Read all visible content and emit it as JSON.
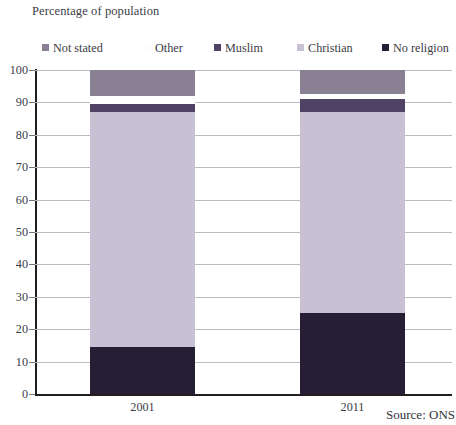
{
  "chart_data": {
    "type": "bar",
    "subtype": "stacked-column-100",
    "title": "Percentage of population",
    "xlabel": "",
    "ylabel": "",
    "ylim": [
      0,
      100
    ],
    "ytick_step": 10,
    "yticks": [
      100,
      90,
      80,
      70,
      60,
      50,
      40,
      30,
      20,
      10,
      0
    ],
    "grid": true,
    "grid_axis": "y",
    "legend_position": "top",
    "categories": [
      "2001",
      "2011"
    ],
    "series": [
      {
        "name": "Not stated",
        "color": "#8a8094",
        "values": [
          8.0,
          7.5
        ]
      },
      {
        "name": "Other",
        "color": "#ffffff",
        "values": [
          2.5,
          1.5
        ]
      },
      {
        "name": "Muslim",
        "color": "#4f4264",
        "values": [
          2.5,
          4.0
        ]
      },
      {
        "name": "Christian",
        "color": "#c8c1d3",
        "values": [
          72.5,
          62.0
        ]
      },
      {
        "name": "No religion",
        "color": "#251e35",
        "values": [
          14.5,
          25.0
        ]
      }
    ],
    "stack_order_bottom_to_top": [
      "No religion",
      "Christian",
      "Muslim",
      "Other",
      "Not stated"
    ],
    "cumulative_tops": {
      "2001": {
        "No religion": 14.5,
        "Christian": 87.0,
        "Muslim": 89.5,
        "Other": 92.0,
        "Not stated": 100
      },
      "2011": {
        "No religion": 25.0,
        "Christian": 87.0,
        "Muslim": 91.0,
        "Other": 92.5,
        "Not stated": 100
      }
    },
    "annotations": [
      "Source: ONS"
    ]
  },
  "legend": {
    "items": [
      {
        "label": "Not stated",
        "color": "#8a8094",
        "swatch": "legend-swatch-not-stated",
        "x": 0
      },
      {
        "label": "Other",
        "color": "#fdfdfd",
        "swatch": "legend-swatch-other",
        "x": 102
      },
      {
        "label": "Muslim",
        "color": "#4f4264",
        "swatch": "legend-swatch-muslim",
        "x": 172
      },
      {
        "label": "Christian",
        "color": "#c8c1d3",
        "swatch": "legend-swatch-christian",
        "x": 255
      },
      {
        "label": "No religion",
        "color": "#251e35",
        "swatch": "legend-swatch-no-religion",
        "x": 340
      }
    ]
  },
  "axis": {
    "y_labels": [
      "100",
      "90",
      "80",
      "70",
      "60",
      "50",
      "40",
      "30",
      "20",
      "10",
      "0"
    ],
    "x_labels": [
      "2001",
      "2011"
    ]
  },
  "source": {
    "text": "Source: ONS"
  }
}
